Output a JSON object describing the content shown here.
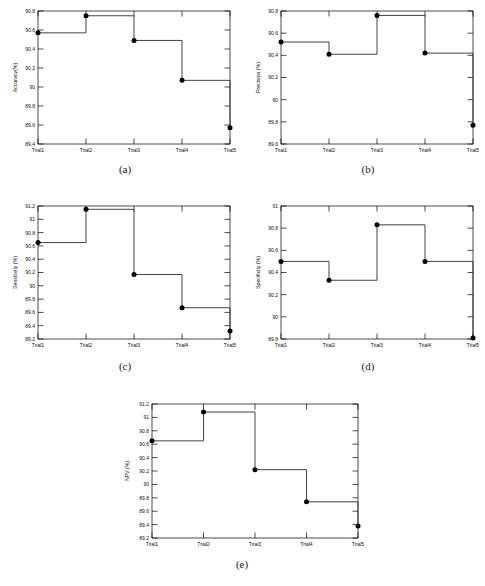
{
  "figure": {
    "panel_count": 5,
    "x_categories": [
      "Trial1",
      "Trial2",
      "Trial3",
      "Trial4",
      "Trial5"
    ],
    "captions": {
      "a": "(a)",
      "b": "(b)",
      "c": "(c)",
      "d": "(d)",
      "e": "(e)"
    },
    "line_color": "#3a3a3a",
    "marker_color": "#000000",
    "axis_color": "#000000",
    "background_color": "#ffffff"
  },
  "chart_data": [
    {
      "id": "a",
      "type": "line",
      "title": "",
      "xlabel": "",
      "ylabel": "Accuracy(%)",
      "categories": [
        "Trial1",
        "Trial2",
        "Trial3",
        "Trial4",
        "Trial5"
      ],
      "values": [
        90.57,
        90.75,
        90.49,
        90.07,
        89.57
      ],
      "ylim": [
        89.4,
        90.8
      ],
      "yticks": [
        89.4,
        89.6,
        89.8,
        90,
        90.2,
        90.4,
        90.6,
        90.8
      ],
      "yticklabels": [
        "89.4",
        "89.6",
        "89.8",
        "90",
        "90.2",
        "90.4",
        "90.6",
        "90.8"
      ],
      "step": "post",
      "markers": true,
      "grid": false,
      "legend": null
    },
    {
      "id": "b",
      "type": "line",
      "title": "",
      "xlabel": "",
      "ylabel": "Precision (%)",
      "categories": [
        "Trial1",
        "Trial2",
        "Trial3",
        "Trial4",
        "Trial5"
      ],
      "values": [
        90.52,
        90.41,
        90.76,
        90.42,
        89.77
      ],
      "ylim": [
        89.6,
        90.8
      ],
      "yticks": [
        89.6,
        89.8,
        90,
        90.2,
        90.4,
        90.6,
        90.8
      ],
      "yticklabels": [
        "89.6",
        "89.8",
        "90",
        "90.2",
        "90.4",
        "90.6",
        "90.8"
      ],
      "step": "post",
      "markers": true,
      "grid": false,
      "legend": null
    },
    {
      "id": "c",
      "type": "line",
      "title": "",
      "xlabel": "",
      "ylabel": "Sensitivity (%)",
      "categories": [
        "Trial1",
        "Trial2",
        "Trial3",
        "Trial4",
        "Trial5"
      ],
      "values": [
        90.65,
        91.15,
        90.17,
        89.67,
        89.32
      ],
      "ylim": [
        89.2,
        91.2
      ],
      "yticks": [
        89.2,
        89.4,
        89.6,
        89.8,
        90,
        90.2,
        90.4,
        90.6,
        90.8,
        91,
        91.2
      ],
      "yticklabels": [
        "89.2",
        "89.4",
        "89.6",
        "89.8",
        "90",
        "90.2",
        "90.4",
        "90.6",
        "90.8",
        "91",
        "91.2"
      ],
      "step": "post",
      "markers": true,
      "grid": false,
      "legend": null
    },
    {
      "id": "d",
      "type": "line",
      "title": "",
      "xlabel": "",
      "ylabel": "Specificity (%)",
      "categories": [
        "Trial1",
        "Trial2",
        "Trial3",
        "Trial4",
        "Trial5"
      ],
      "values": [
        90.5,
        90.33,
        90.83,
        90.5,
        89.81
      ],
      "ylim": [
        89.8,
        91.0
      ],
      "yticks": [
        89.8,
        90,
        90.2,
        90.4,
        90.6,
        90.8,
        91
      ],
      "yticklabels": [
        "89.8",
        "90",
        "90.2",
        "90.4",
        "90.6",
        "90.8",
        "91"
      ],
      "step": "post",
      "markers": true,
      "grid": false,
      "legend": null
    },
    {
      "id": "e",
      "type": "line",
      "title": "",
      "xlabel": "",
      "ylabel": "NPV (%)",
      "categories": [
        "Trial1",
        "Trial2",
        "Trial3",
        "Trial4",
        "Trial5"
      ],
      "values": [
        90.65,
        91.08,
        90.22,
        89.74,
        89.38
      ],
      "ylim": [
        89.2,
        91.2
      ],
      "yticks": [
        89.2,
        89.4,
        89.6,
        89.8,
        90,
        90.2,
        90.4,
        90.6,
        90.8,
        91,
        91.2
      ],
      "yticklabels": [
        "89.2",
        "89.4",
        "89.6",
        "89.8",
        "90",
        "90.2",
        "90.4",
        "90.6",
        "90.8",
        "91",
        "91.2"
      ],
      "step": "post",
      "markers": true,
      "grid": false,
      "legend": null
    }
  ]
}
